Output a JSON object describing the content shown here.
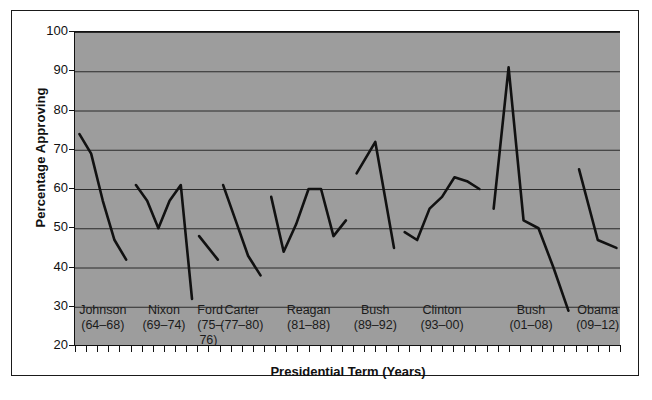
{
  "chart_data": {
    "type": "line",
    "title": "",
    "xlabel": "Presidential Term (Years)",
    "ylabel": "Percentage Approving",
    "ylim": [
      20,
      100
    ],
    "ytick_labels": [
      "100",
      "90",
      "80",
      "70",
      "60",
      "50",
      "40",
      "30",
      "20"
    ],
    "ytick_values": [
      100,
      90,
      80,
      70,
      60,
      50,
      40,
      30,
      20
    ],
    "grid": true,
    "legend": "none",
    "plot_background": "#9d9d9d",
    "line_color": "#111111",
    "categories": [
      "Johnson (64-68)",
      "Nixon (69-74)",
      "Ford (75-76)",
      "Carter (77-80)",
      "Reagan (81-88)",
      "Bush (89-92)",
      "Clinton (93-00)",
      "Bush (01-08)",
      "Obama (09-12)"
    ],
    "terms": [
      {
        "name": "Johnson",
        "years": "(64–68)",
        "start_year": 1964,
        "end_year": 1968,
        "values": [
          74,
          69,
          57,
          47,
          42
        ]
      },
      {
        "name": "Nixon",
        "years": "(69–74)",
        "start_year": 1969,
        "end_year": 1974,
        "values": [
          61,
          57,
          50,
          57,
          61,
          32
        ]
      },
      {
        "name": "Ford",
        "years": "(75–76)",
        "start_year": 1975,
        "end_year": 1976,
        "values": [
          48,
          42
        ]
      },
      {
        "name": "Carter",
        "years": "(77–80)",
        "start_year": 1977,
        "end_year": 1980,
        "values": [
          61,
          52,
          43,
          38
        ]
      },
      {
        "name": "Reagan",
        "years": "(81–88)",
        "start_year": 1981,
        "end_year": 1988,
        "values": [
          58,
          44,
          51,
          60,
          60,
          48,
          52
        ]
      },
      {
        "name": "Bush",
        "years": "(89–92)",
        "start_year": 1989,
        "end_year": 1992,
        "values": [
          64,
          72,
          45
        ]
      },
      {
        "name": "Clinton",
        "years": "(93–00)",
        "start_year": 1993,
        "end_year": 2000,
        "values": [
          49,
          47,
          55,
          58,
          63,
          62,
          60
        ]
      },
      {
        "name": "Bush",
        "years": "(01–08)",
        "start_year": 2001,
        "end_year": 2008,
        "values": [
          55,
          91,
          52,
          50,
          40,
          29
        ]
      },
      {
        "name": "Obama",
        "years": "(09–12)",
        "start_year": 2009,
        "end_year": 2012,
        "values": [
          65,
          47,
          45
        ]
      }
    ]
  },
  "axis": {
    "y_label": "Percentage Approving",
    "x_label": "Presidential Term (Years)"
  }
}
